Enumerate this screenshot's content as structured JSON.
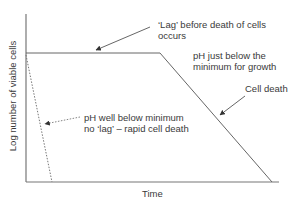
{
  "diagram": {
    "y_axis_label": "Log number of viable cells",
    "x_axis_label": "Time",
    "annotations": {
      "lag": [
        "‘Lag’ before death of cells",
        "occurs"
      ],
      "ph_just_below": [
        "pH just below the",
        "minimum for growth"
      ],
      "cell_death": "Cell death",
      "ph_well_below": [
        "pH well below minimum",
        "no ‘lag’ – rapid cell death"
      ]
    },
    "curves": [
      {
        "name": "pH just below minimum",
        "style": "solid",
        "points": [
          [
            0,
            "high"
          ],
          [
            "lag end",
            "high"
          ],
          [
            "later",
            "zero"
          ]
        ]
      },
      {
        "name": "pH well below minimum",
        "style": "dotted",
        "points": [
          [
            0,
            "high"
          ],
          [
            "early",
            "zero"
          ]
        ]
      }
    ],
    "colors": {
      "lines": "#555555",
      "text": "#3a3a3a"
    }
  }
}
